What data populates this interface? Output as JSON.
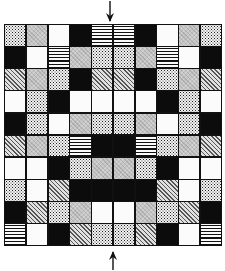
{
  "figure": {
    "columns": 10,
    "rows_count": 10,
    "legend_patterns": {
      "white": "blank tile",
      "black": "solid black tile",
      "gray": "fine light gray screen",
      "diag": "diagonal hatching",
      "dots": "stippled dots",
      "hlines": "horizontal stripes"
    },
    "rows": [
      [
        "dots",
        "gray",
        "white",
        "black",
        "hlines",
        "hlines",
        "black",
        "white",
        "gray",
        "dots"
      ],
      [
        "black",
        "white",
        "hlines",
        "gray",
        "dots",
        "dots",
        "gray",
        "hlines",
        "white",
        "black"
      ],
      [
        "diag",
        "gray",
        "dots",
        "black",
        "diag",
        "diag",
        "black",
        "dots",
        "gray",
        "diag"
      ],
      [
        "white",
        "dots",
        "black",
        "white",
        "white",
        "white",
        "white",
        "black",
        "dots",
        "white"
      ],
      [
        "black",
        "dots",
        "white",
        "gray",
        "dots",
        "dots",
        "gray",
        "white",
        "dots",
        "black"
      ],
      [
        "diag",
        "gray",
        "dots",
        "hlines",
        "black",
        "black",
        "hlines",
        "dots",
        "gray",
        "diag"
      ],
      [
        "white",
        "white",
        "black",
        "dots",
        "gray",
        "gray",
        "dots",
        "black",
        "white",
        "white"
      ],
      [
        "dots",
        "white",
        "diag",
        "black",
        "black",
        "black",
        "black",
        "diag",
        "white",
        "dots"
      ],
      [
        "black",
        "diag",
        "dots",
        "gray",
        "white",
        "white",
        "gray",
        "dots",
        "diag",
        "black"
      ],
      [
        "hlines",
        "white",
        "black",
        "diag",
        "dots",
        "dots",
        "diag",
        "black",
        "white",
        "hlines"
      ]
    ],
    "arrows": [
      {
        "position": "top-center",
        "direction": "down"
      },
      {
        "position": "bottom-center",
        "direction": "up"
      }
    ]
  }
}
